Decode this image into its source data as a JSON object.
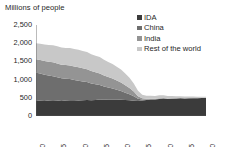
{
  "chart_data": {
    "type": "area",
    "stacked": true,
    "title": "Millions of people",
    "xlabel": "",
    "ylabel": "Millions of people",
    "ylim": [
      0,
      2500
    ],
    "xlim": [
      1990,
      2030
    ],
    "grid": false,
    "legend_position": "top-right",
    "ytick_labels": [
      "2,500",
      "2,000",
      "1,500",
      "1,000",
      "500",
      "0"
    ],
    "ytick_values": [
      2500,
      2000,
      1500,
      1000,
      500,
      0
    ],
    "xtick_labels": [
      "1990",
      "1995",
      "2000",
      "2005",
      "2010",
      "2015",
      "2020",
      "2025",
      "2030"
    ],
    "xtick_values": [
      1990,
      1995,
      2000,
      2005,
      2010,
      2015,
      2020,
      2025,
      2030
    ],
    "x": [
      1990,
      1991,
      1992,
      1993,
      1994,
      1995,
      1996,
      1997,
      1998,
      1999,
      2000,
      2001,
      2002,
      2003,
      2004,
      2005,
      2006,
      2007,
      2008,
      2009,
      2010,
      2011,
      2012,
      2013,
      2014,
      2015,
      2016,
      2017,
      2018,
      2019,
      2020,
      2021,
      2022,
      2023,
      2024,
      2025,
      2026,
      2027,
      2028,
      2029,
      2030
    ],
    "series": [
      {
        "name": "IDA",
        "color": "#3b3b3b",
        "values": [
          430,
          420,
          415,
          425,
          435,
          425,
          415,
          425,
          435,
          430,
          425,
          430,
          440,
          435,
          440,
          450,
          445,
          450,
          455,
          450,
          445,
          440,
          430,
          420,
          415,
          425,
          440,
          450,
          455,
          470,
          480,
          470,
          475,
          480,
          485,
          480,
          485,
          490,
          490,
          495,
          495
        ]
      },
      {
        "name": "China",
        "color": "#6e6e6e",
        "values": [
          760,
          745,
          720,
          690,
          660,
          640,
          620,
          600,
          580,
          560,
          545,
          520,
          495,
          460,
          430,
          400,
          365,
          330,
          300,
          270,
          240,
          200,
          165,
          120,
          60,
          25,
          12,
          8,
          6,
          5,
          4,
          3,
          3,
          2,
          2,
          2,
          1,
          1,
          1,
          1,
          1
        ]
      },
      {
        "name": "India",
        "color": "#949494",
        "values": [
          370,
          372,
          375,
          378,
          380,
          378,
          376,
          374,
          372,
          370,
          368,
          360,
          350,
          340,
          330,
          320,
          305,
          290,
          275,
          255,
          235,
          205,
          175,
          130,
          70,
          35,
          22,
          16,
          12,
          10,
          9,
          8,
          7,
          6,
          6,
          5,
          5,
          4,
          4,
          4,
          4
        ]
      },
      {
        "name": "Rest of the world",
        "color": "#c8c8c8",
        "values": [
          440,
          450,
          455,
          460,
          470,
          470,
          468,
          470,
          478,
          480,
          480,
          475,
          470,
          460,
          455,
          450,
          430,
          415,
          400,
          380,
          360,
          320,
          280,
          220,
          150,
          100,
          85,
          80,
          78,
          85,
          80,
          70,
          62,
          56,
          50,
          46,
          42,
          38,
          34,
          31,
          28
        ]
      }
    ],
    "totals": [
      2000,
      1987,
      1965,
      1953,
      1945,
      1913,
      1879,
      1869,
      1865,
      1840,
      1818,
      1785,
      1755,
      1695,
      1655,
      1620,
      1545,
      1485,
      1430,
      1355,
      1280,
      1165,
      1050,
      890,
      695,
      585,
      559,
      554,
      551,
      570,
      573,
      551,
      547,
      544,
      543,
      533,
      533,
      533,
      529,
      531,
      528
    ]
  },
  "legend": {
    "items": [
      {
        "label": "IDA",
        "color": "#3b3b3b"
      },
      {
        "label": "China",
        "color": "#6e6e6e"
      },
      {
        "label": "India",
        "color": "#949494"
      },
      {
        "label": "Rest of the world",
        "color": "#c8c8c8"
      }
    ]
  }
}
